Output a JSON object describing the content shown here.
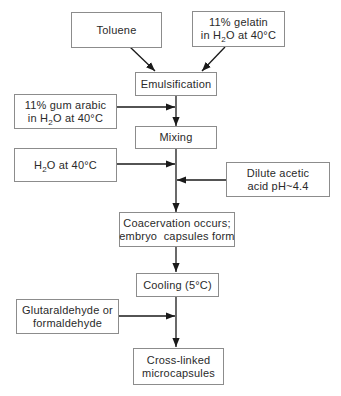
{
  "diagram": {
    "type": "flowchart",
    "title": "",
    "nodes": [
      {
        "id": "toluene",
        "lines": [
          "Toluene"
        ]
      },
      {
        "id": "gelatin",
        "lines": [
          "11% gelatin",
          "in H2O at 40°C"
        ]
      },
      {
        "id": "emulsification",
        "lines": [
          "Emulsification"
        ]
      },
      {
        "id": "gum_arabic",
        "lines": [
          "11% gum arabic",
          "in H2O at 40°C"
        ]
      },
      {
        "id": "mixing",
        "lines": [
          "Mixing"
        ]
      },
      {
        "id": "water",
        "lines": [
          "H2O at 40°C"
        ]
      },
      {
        "id": "acetic_acid",
        "lines": [
          "Dilute acetic",
          "acid pH~4.4"
        ]
      },
      {
        "id": "coacervation",
        "lines": [
          "Coacervation occurs;",
          "embryo  capsules form"
        ]
      },
      {
        "id": "cooling",
        "lines": [
          "Cooling (5°C)"
        ]
      },
      {
        "id": "crosslinker",
        "lines": [
          "Glutaraldehyde or",
          "formaldehyde"
        ]
      },
      {
        "id": "microcapsules",
        "lines": [
          "Cross-linked",
          "microcapsules"
        ]
      }
    ],
    "edges": [
      {
        "from": "toluene",
        "to": "emulsification"
      },
      {
        "from": "gelatin",
        "to": "emulsification"
      },
      {
        "from": "emulsification",
        "to": "mixing"
      },
      {
        "from": "gum_arabic",
        "to": "emulsification-mixing-line"
      },
      {
        "from": "mixing",
        "to": "coacervation"
      },
      {
        "from": "water",
        "to": "mixing-coacervation-line"
      },
      {
        "from": "acetic_acid",
        "to": "mixing-coacervation-line"
      },
      {
        "from": "coacervation",
        "to": "cooling"
      },
      {
        "from": "cooling",
        "to": "microcapsules"
      },
      {
        "from": "crosslinker",
        "to": "cooling-microcapsules-line"
      }
    ]
  },
  "labels": {
    "toluene": "Toluene",
    "gelatin_l1": "11% gelatin",
    "gelatin_l2_pre": "in H",
    "gelatin_l2_sub": "2",
    "gelatin_l2_post": "O at 40°C",
    "emulsification": "Emulsification",
    "gum_l1": "11% gum arabic",
    "gum_l2_pre": "in H",
    "gum_l2_sub": "2",
    "gum_l2_post": "O at 40°C",
    "mixing": "Mixing",
    "water_pre": "H",
    "water_sub": "2",
    "water_post": "O at 40°C",
    "acetic_l1": "Dilute acetic",
    "acetic_l2": "acid pH~4.4",
    "coacervation_l1": "Coacervation occurs;",
    "coacervation_l2": "embryo  capsules form",
    "cooling": "Cooling (5°C)",
    "crosslinker_l1": "Glutaraldehyde or",
    "crosslinker_l2": "formaldehyde",
    "microcapsules_l1": "Cross-linked",
    "microcapsules_l2": "microcapsules"
  },
  "colors": {
    "line": "#1a1a1a",
    "border": "#8c8c8c",
    "text": "#2a2a2a",
    "background": "#ffffff"
  }
}
